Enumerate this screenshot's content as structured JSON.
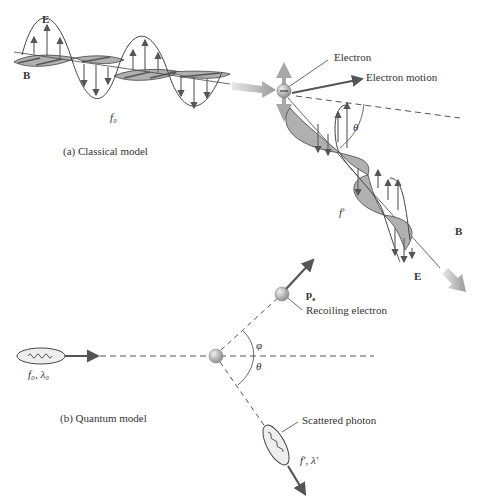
{
  "classical": {
    "caption": "(a) Classical model",
    "incident_E": "E",
    "incident_B": "B",
    "incident_freq": "f₀",
    "electron_label": "Electron",
    "electron_motion_label": "Electron motion",
    "angle_label": "θ",
    "scattered_freq": "f′",
    "scattered_B": "B",
    "scattered_E": "E"
  },
  "quantum": {
    "caption": "(b) Quantum model",
    "incident_photon_label": "f₀, λ₀",
    "electron_momentum_label": "p",
    "electron_momentum_sub": "e",
    "recoiling_electron_label": "Recoiling electron",
    "phi_label": "φ",
    "theta_label": "θ",
    "scattered_photon_label": "Scattered photon",
    "scattered_photon_params": "f′, λ′"
  },
  "colors": {
    "line": "#444444",
    "wave_fill": "#b0b0b0",
    "arrow_gray": "#9a9a9a",
    "electron": "#a8a8a8"
  }
}
